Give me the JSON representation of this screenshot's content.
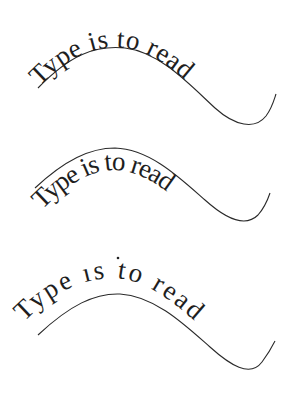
{
  "examples": [
    {
      "id": "example-1",
      "text": "Type is to read",
      "placement": "baseline on path",
      "path_color": "#2a2a2a",
      "text_color": "#1e1e1e"
    },
    {
      "id": "example-2",
      "text": "Type is to read",
      "placement": "text hanging below path, tight tracking",
      "path_color": "#2a2a2a",
      "text_color": "#1e1e1e"
    },
    {
      "id": "example-3",
      "text": "Type ıs to read",
      "placement": "text above path, wide tracking",
      "path_color": "#2a2a2a",
      "text_color": "#1e1e1e"
    }
  ],
  "stray_dot": {
    "x": 118,
    "y": 258
  }
}
